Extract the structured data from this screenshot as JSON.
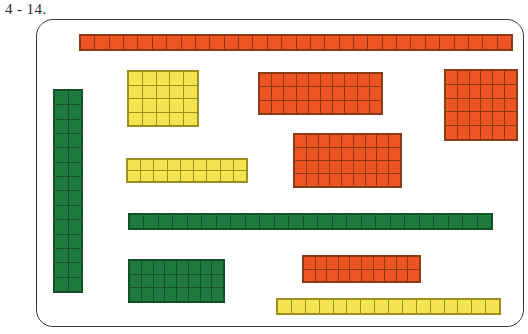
{
  "exercise": {
    "label": "4 - 14."
  },
  "panel": {
    "name": "worksheet-panel",
    "border_color": "#3a3a3a",
    "background": "#ffffff"
  },
  "colors": {
    "orange": "#ef5423",
    "yellow": "#f5e34f",
    "green": "#1f7a3d",
    "grid_line": "#4a4a4a",
    "panel_border": "#3a3a3a",
    "text": "#2b2b2b"
  },
  "blocks": [
    {
      "id": "orange-top-strip",
      "color": "orange",
      "cols": 30,
      "rows": 1,
      "count": 30,
      "x": 78,
      "y": 33,
      "w": 434,
      "h": 17
    },
    {
      "id": "yellow-square-block",
      "color": "yellow",
      "cols": 5,
      "rows": 4,
      "count": 20,
      "x": 126,
      "y": 69,
      "w": 72,
      "h": 57
    },
    {
      "id": "orange-upper-mid-block",
      "color": "orange",
      "cols": 10,
      "rows": 3,
      "count": 30,
      "x": 257,
      "y": 71,
      "w": 125,
      "h": 43
    },
    {
      "id": "orange-upper-right-block",
      "color": "orange",
      "cols": 6,
      "rows": 5,
      "count": 30,
      "x": 443,
      "y": 68,
      "w": 74,
      "h": 72
    },
    {
      "id": "green-tall-column",
      "color": "green",
      "cols": 2,
      "rows": 14,
      "count": 28,
      "x": 52,
      "y": 88,
      "w": 30,
      "h": 204
    },
    {
      "id": "orange-mid-right-block",
      "color": "orange",
      "cols": 9,
      "rows": 4,
      "count": 36,
      "x": 292,
      "y": 132,
      "w": 109,
      "h": 55
    },
    {
      "id": "yellow-short-strip",
      "color": "yellow",
      "cols": 9,
      "rows": 2,
      "count": 18,
      "x": 125,
      "y": 157,
      "w": 122,
      "h": 25
    },
    {
      "id": "green-long-strip",
      "color": "green",
      "cols": 25,
      "rows": 1,
      "count": 25,
      "x": 127,
      "y": 212,
      "w": 365,
      "h": 17
    },
    {
      "id": "orange-lower-right-block",
      "color": "orange",
      "cols": 10,
      "rows": 2,
      "count": 20,
      "x": 301,
      "y": 254,
      "w": 119,
      "h": 28
    },
    {
      "id": "green-bottom-block",
      "color": "green",
      "cols": 8,
      "rows": 3,
      "count": 24,
      "x": 127,
      "y": 258,
      "w": 97,
      "h": 44
    },
    {
      "id": "yellow-bottom-strip",
      "color": "yellow",
      "cols": 16,
      "rows": 1,
      "count": 16,
      "x": 275,
      "y": 297,
      "w": 225,
      "h": 17
    }
  ]
}
